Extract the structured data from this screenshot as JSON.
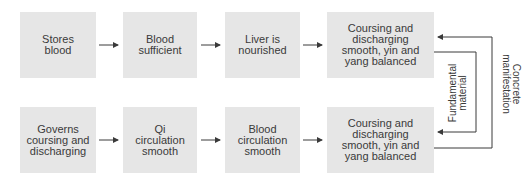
{
  "diagram": {
    "row1": [
      {
        "label": "Stores\nblood"
      },
      {
        "label": "Blood\nsufficient"
      },
      {
        "label": "Liver is\nnourished"
      },
      {
        "label": "Coursing and\ndischarging\nsmooth, yin and\nyang balanced"
      }
    ],
    "row2": [
      {
        "label": "Governs\ncoursing and\ndischarging"
      },
      {
        "label": "Qi\ncirculation\nsmooth"
      },
      {
        "label": "Blood\ncirculation\nsmooth"
      },
      {
        "label": "Coursing and\ndischarging\nsmooth, yin and\nyang balanced"
      }
    ],
    "connectors": {
      "inner_label": "Fundamental\nmaterial",
      "outer_label": "Concrete\nmanifestation"
    },
    "colors": {
      "box_fill": "#e6e6e6",
      "line": "#3a3a3a",
      "text": "#3a3a3a"
    }
  }
}
